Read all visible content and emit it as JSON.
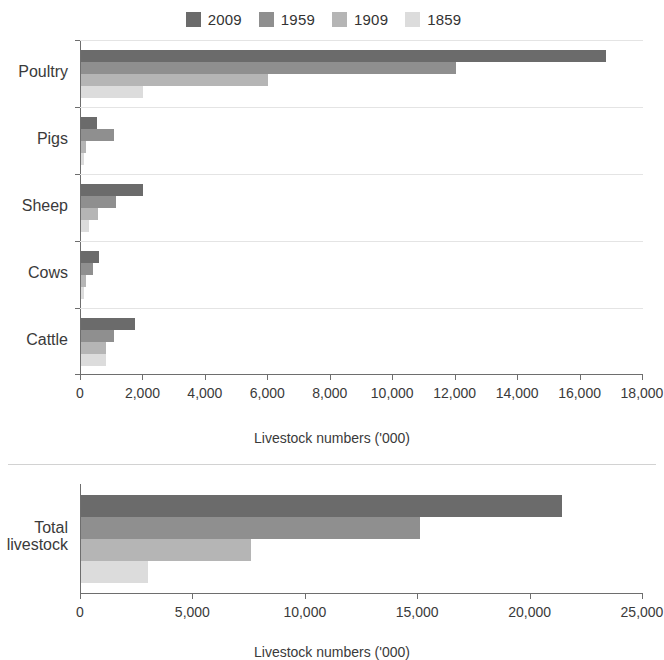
{
  "legend": {
    "position": "top-center",
    "entries": [
      {
        "label": "2009",
        "color": "#6b6b6b"
      },
      {
        "label": "1959",
        "color": "#8f8f8f"
      },
      {
        "label": "1909",
        "color": "#b5b5b5"
      },
      {
        "label": "1859",
        "color": "#dcdcdc"
      }
    ]
  },
  "chart_data": [
    {
      "id": "livestock-by-type",
      "type": "bar",
      "orientation": "horizontal",
      "title": "",
      "xlabel": "Livestock numbers ('000)",
      "ylabel": "",
      "xlim": [
        0,
        18000
      ],
      "xticks": [
        0,
        2000,
        4000,
        6000,
        8000,
        10000,
        12000,
        14000,
        16000,
        18000
      ],
      "xticklabels": [
        "0",
        "2,000",
        "4,000",
        "6,000",
        "8,000",
        "10,000",
        "12,000",
        "14,000",
        "16,000",
        "18,000"
      ],
      "categories": [
        "Poultry",
        "Pigs",
        "Sheep",
        "Cows",
        "Cattle"
      ],
      "grid": true,
      "legend_position": "top-center",
      "series": [
        {
          "name": "2009",
          "color": "#6b6b6b",
          "values": [
            16830,
            500,
            2000,
            580,
            1730
          ]
        },
        {
          "name": "1959",
          "color": "#8f8f8f",
          "values": [
            12000,
            1050,
            1120,
            380,
            1050
          ]
        },
        {
          "name": "1909",
          "color": "#b5b5b5",
          "values": [
            5990,
            160,
            550,
            160,
            800
          ]
        },
        {
          "name": "1859",
          "color": "#dcdcdc",
          "values": [
            1980,
            100,
            250,
            90,
            800
          ]
        }
      ]
    },
    {
      "id": "total-livestock",
      "type": "bar",
      "orientation": "horizontal",
      "title": "",
      "xlabel": "Livestock numbers ('000)",
      "ylabel": "",
      "xlim": [
        0,
        25000
      ],
      "xticks": [
        0,
        5000,
        10000,
        15000,
        20000,
        25000
      ],
      "xticklabels": [
        "0",
        "5,000",
        "10,000",
        "15,000",
        "20,000",
        "25,000"
      ],
      "categories": [
        "Total livestock"
      ],
      "grid": false,
      "legend_position": "shared-top",
      "series": [
        {
          "name": "2009",
          "color": "#6b6b6b",
          "values": [
            21400
          ]
        },
        {
          "name": "1959",
          "color": "#8f8f8f",
          "values": [
            15100
          ]
        },
        {
          "name": "1909",
          "color": "#b5b5b5",
          "values": [
            7550
          ]
        },
        {
          "name": "1859",
          "color": "#dcdcdc",
          "values": [
            3000
          ]
        }
      ]
    }
  ],
  "labels": {
    "category_top": [
      "Poultry",
      "Pigs",
      "Sheep",
      "Cows",
      "Cattle"
    ],
    "category_bottom_line1": "Total",
    "category_bottom_line2": "livestock",
    "axis_title_top": "Livestock numbers ('000)",
    "axis_title_bottom": "Livestock numbers ('000)"
  }
}
